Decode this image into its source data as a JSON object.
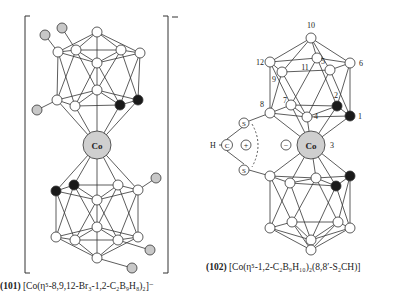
{
  "figure": {
    "colors": {
      "line": "#333333",
      "boron": "#ffffff",
      "carbon": "#1a1a1a",
      "bromine": "#c8c8c8",
      "cobalt": "#cfcfcf"
    },
    "compound_101": {
      "number": "(101)",
      "formula": "[Co(η⁵-8,9,12-Br₃-1,2-C₂B₉H₈)₂]⁻",
      "metal_label": "Co",
      "charge": "−"
    },
    "compound_102": {
      "number": "(102)",
      "formula": "[Co(η⁵-1,2-C₂B₉H₁₀)₂(8,8′-S₂CH)]",
      "metal_label": "Co",
      "atom_labels": [
        "10",
        "12",
        "11",
        "5",
        "6",
        "9",
        "7",
        "2",
        "8",
        "4",
        "1",
        "3"
      ],
      "bridge": {
        "h": "H",
        "c": "C",
        "s_top": "S",
        "s_bottom": "S",
        "plus": "+",
        "minus": "−"
      }
    }
  }
}
